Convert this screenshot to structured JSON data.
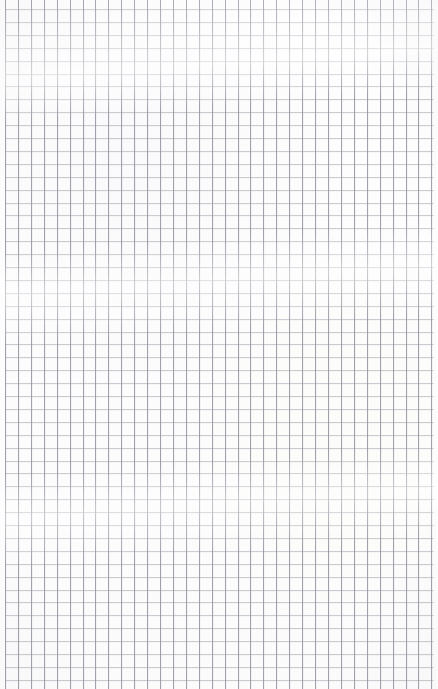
{
  "image": {
    "subject": "graph-paper-sheet",
    "description": "Blank sheet of squared graph paper photographed flat, filling the entire frame",
    "content_text": "",
    "has_writing": false,
    "has_text": false,
    "has_ui_controls": false,
    "width_px": 438,
    "height_px": 689
  },
  "paper": {
    "background_color": "#fdfdfd",
    "tint": "neutral-white",
    "surface": "matte",
    "orientation": "portrait"
  },
  "grid": {
    "style": "uniform-square-quadrille",
    "cell_pitch_x_px": 12.92,
    "cell_pitch_y_px": 12.9,
    "line_width_px": 1,
    "vertical_line_color": "#7e7e8c",
    "horizontal_line_color": "#9696a2",
    "first_vertical_line_x_px": 5,
    "first_horizontal_line_y_px": 9,
    "vertical_line_count": 34,
    "horizontal_line_count": 53,
    "has_major_minor_lines": false,
    "margin_left_px": 5,
    "margin_right_px": 5
  },
  "artifacts": {
    "sheen_bands": "soft horizontal highlight bands from the light source",
    "vignette": "subtle darkening toward the corners",
    "grain": "fine paper fibre texture",
    "line_bleed": "slight doubling of rules from sheet curvature"
  }
}
